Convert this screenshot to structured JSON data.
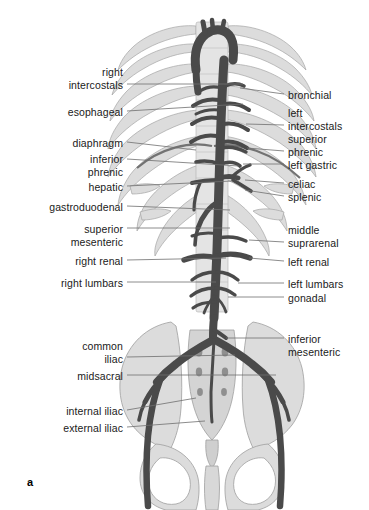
{
  "figure": {
    "panel_letter": "a",
    "width": 369,
    "height": 510,
    "background": "#ffffff"
  },
  "colors": {
    "vessel": "#4a4a4a",
    "vessel_dark": "#3f3f3f",
    "bone_fill": "#dcdcdc",
    "bone_fill_light": "#e6e6e6",
    "bone_outline": "#9a9a9a",
    "leader_line": "#6e6e6e",
    "text": "#1a1a1a"
  },
  "labels_left": [
    {
      "id": "right-intercostals",
      "lines": [
        "right",
        "intercostals"
      ],
      "x": 123,
      "y": 66,
      "leader": {
        "x1": 127,
        "y1": 84,
        "x2": 243,
        "y2": 84
      }
    },
    {
      "id": "esophageal",
      "lines": [
        "esophageal"
      ],
      "x": 123,
      "y": 106,
      "leader": {
        "x1": 127,
        "y1": 111,
        "x2": 243,
        "y2": 104
      }
    },
    {
      "id": "diaphragm",
      "lines": [
        "diaphragm"
      ],
      "x": 123,
      "y": 137,
      "leader": {
        "x1": 127,
        "y1": 142,
        "x2": 196,
        "y2": 150
      }
    },
    {
      "id": "inferior-phrenic",
      "lines": [
        "inferior",
        "phrenic"
      ],
      "x": 123,
      "y": 153,
      "leader": {
        "x1": 127,
        "y1": 159,
        "x2": 239,
        "y2": 166
      }
    },
    {
      "id": "hepatic",
      "lines": [
        "hepatic"
      ],
      "x": 123,
      "y": 181,
      "leader": {
        "x1": 127,
        "y1": 186,
        "x2": 232,
        "y2": 181
      }
    },
    {
      "id": "gastroduodenal",
      "lines": [
        "gastroduodenal"
      ],
      "x": 123,
      "y": 201,
      "leader": {
        "x1": 127,
        "y1": 206,
        "x2": 230,
        "y2": 210
      }
    },
    {
      "id": "superior-mesenteric",
      "lines": [
        "superior",
        "mesenteric"
      ],
      "x": 123,
      "y": 223,
      "leader": {
        "x1": 127,
        "y1": 228,
        "x2": 230,
        "y2": 228
      }
    },
    {
      "id": "right-renal",
      "lines": [
        "right renal"
      ],
      "x": 123,
      "y": 255,
      "leader": {
        "x1": 127,
        "y1": 260,
        "x2": 226,
        "y2": 258
      }
    },
    {
      "id": "right-lumbars",
      "lines": [
        "right lumbars"
      ],
      "x": 123,
      "y": 277,
      "leader": {
        "x1": 127,
        "y1": 282,
        "x2": 216,
        "y2": 282
      }
    },
    {
      "id": "common-iliac",
      "lines": [
        "common",
        "iliac"
      ],
      "x": 123,
      "y": 340,
      "leader": {
        "x1": 127,
        "y1": 357,
        "x2": 235,
        "y2": 355
      }
    },
    {
      "id": "midsacral",
      "lines": [
        "midsacral"
      ],
      "x": 123,
      "y": 370,
      "leader": {
        "x1": 127,
        "y1": 375,
        "x2": 276,
        "y2": 375
      }
    },
    {
      "id": "internal-iliac",
      "lines": [
        "internal iliac"
      ],
      "x": 123,
      "y": 405,
      "leader": {
        "x1": 127,
        "y1": 410,
        "x2": 196,
        "y2": 398
      }
    },
    {
      "id": "external-iliac",
      "lines": [
        "external iliac"
      ],
      "x": 123,
      "y": 422,
      "leader": {
        "x1": 127,
        "y1": 427,
        "x2": 205,
        "y2": 421
      }
    }
  ],
  "labels_right": [
    {
      "id": "bronchial",
      "lines": [
        "bronchial"
      ],
      "x": 288,
      "y": 89,
      "leader": {
        "x1": 284,
        "y1": 94,
        "x2": 240,
        "y2": 88
      }
    },
    {
      "id": "left-intercostals",
      "lines": [
        "left",
        "intercostals"
      ],
      "x": 288,
      "y": 107,
      "leader": {
        "x1": 284,
        "y1": 125,
        "x2": 246,
        "y2": 124
      }
    },
    {
      "id": "superior-phrenic",
      "lines": [
        "superior",
        "phrenic"
      ],
      "x": 288,
      "y": 133,
      "leader": {
        "x1": 284,
        "y1": 151,
        "x2": 247,
        "y2": 148
      }
    },
    {
      "id": "left-gastric",
      "lines": [
        "left gastric"
      ],
      "x": 288,
      "y": 159,
      "leader": {
        "x1": 284,
        "y1": 164,
        "x2": 243,
        "y2": 164
      }
    },
    {
      "id": "celiac",
      "lines": [
        "celiac"
      ],
      "x": 288,
      "y": 178,
      "leader": {
        "x1": 284,
        "y1": 183,
        "x2": 245,
        "y2": 180
      }
    },
    {
      "id": "splenic",
      "lines": [
        "splenic"
      ],
      "x": 288,
      "y": 191,
      "leader": {
        "x1": 284,
        "y1": 196,
        "x2": 245,
        "y2": 190
      }
    },
    {
      "id": "middle-suprarenal",
      "lines": [
        "middle",
        "suprarenal"
      ],
      "x": 288,
      "y": 224,
      "leader": {
        "x1": 284,
        "y1": 242,
        "x2": 249,
        "y2": 240
      }
    },
    {
      "id": "left-renal",
      "lines": [
        "left renal"
      ],
      "x": 288,
      "y": 256,
      "leader": {
        "x1": 284,
        "y1": 261,
        "x2": 249,
        "y2": 258
      }
    },
    {
      "id": "left-lumbars",
      "lines": [
        "left lumbars"
      ],
      "x": 288,
      "y": 278,
      "leader": {
        "x1": 284,
        "y1": 283,
        "x2": 238,
        "y2": 283
      }
    },
    {
      "id": "gonadal",
      "lines": [
        "gonadal"
      ],
      "x": 288,
      "y": 292,
      "leader": {
        "x1": 284,
        "y1": 297,
        "x2": 228,
        "y2": 297
      }
    },
    {
      "id": "inferior-mesenteric",
      "lines": [
        "inferior",
        "mesenteric"
      ],
      "x": 288,
      "y": 333,
      "leader": {
        "x1": 284,
        "y1": 338,
        "x2": 226,
        "y2": 338
      }
    }
  ]
}
